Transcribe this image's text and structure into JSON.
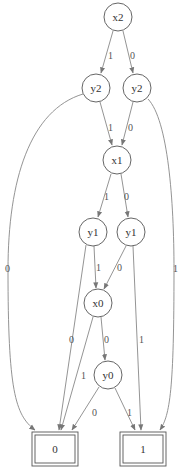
{
  "diagram": {
    "type": "binary-decision-diagram",
    "nodes": [
      {
        "id": "n_x2",
        "label": "x2",
        "cx": 118,
        "cy": 17
      },
      {
        "id": "n_y2a",
        "label": "y2",
        "cx": 96,
        "cy": 88
      },
      {
        "id": "n_y2b",
        "label": "y2",
        "cx": 137,
        "cy": 88
      },
      {
        "id": "n_x1",
        "label": "x1",
        "cx": 117,
        "cy": 160
      },
      {
        "id": "n_y1a",
        "label": "y1",
        "cx": 93,
        "cy": 232
      },
      {
        "id": "n_y1b",
        "label": "y1",
        "cx": 131,
        "cy": 232
      },
      {
        "id": "n_x0",
        "label": "x0",
        "cx": 98,
        "cy": 303
      },
      {
        "id": "n_y0",
        "label": "y0",
        "cx": 108,
        "cy": 375
      }
    ],
    "terminals": [
      {
        "id": "t0",
        "label": "0",
        "x": 32,
        "y": 432,
        "w": 46,
        "h": 34
      },
      {
        "id": "t1",
        "label": "1",
        "x": 120,
        "y": 432,
        "w": 46,
        "h": 34
      }
    ],
    "edges": [
      {
        "from": "x2",
        "to": "y2 (left)",
        "label": "1",
        "lx": 108,
        "ly": 56
      },
      {
        "from": "x2",
        "to": "y2 (right)",
        "label": "0",
        "lx": 130,
        "ly": 56
      },
      {
        "from": "y2 (left)",
        "to": "x1",
        "label": "1",
        "lx": 108,
        "ly": 129
      },
      {
        "from": "y2 (right)",
        "to": "x1",
        "label": "0",
        "lx": 129,
        "ly": 129
      },
      {
        "from": "y2 (left)",
        "to": "0",
        "label": "0",
        "lx": 8,
        "ly": 270
      },
      {
        "from": "y2 (right)",
        "to": "1",
        "label": "1",
        "lx": 174,
        "ly": 270
      },
      {
        "from": "x1",
        "to": "y1 (left)",
        "label": "1",
        "lx": 104,
        "ly": 200
      },
      {
        "from": "x1",
        "to": "y1 (right)",
        "label": "0",
        "lx": 125,
        "ly": 200
      },
      {
        "from": "y1 (left)",
        "to": "x0",
        "label": "1",
        "lx": 96,
        "ly": 271
      },
      {
        "from": "y1 (right)",
        "to": "x0",
        "label": "0",
        "lx": 117,
        "ly": 271
      },
      {
        "from": "y1 (left)",
        "to": "0",
        "label": "0",
        "lx": 72,
        "ly": 342
      },
      {
        "from": "y1 (right)",
        "to": "1",
        "label": "1",
        "lx": 139,
        "ly": 342
      },
      {
        "from": "x0",
        "to": "y0",
        "label": "0",
        "lx": 106,
        "ly": 342
      },
      {
        "from": "x0",
        "to": "0",
        "label": "1",
        "lx": 81,
        "ly": 377
      },
      {
        "from": "y0",
        "to": "0",
        "label": "0",
        "lx": 93,
        "ly": 414
      },
      {
        "from": "y0",
        "to": "1",
        "label": "1",
        "lx": 128,
        "ly": 414
      }
    ]
  },
  "labels": {
    "x2": "x2",
    "y2a": "y2",
    "y2b": "y2",
    "x1": "x1",
    "y1a": "y1",
    "y1b": "y1",
    "x0": "x0",
    "y0": "y0",
    "t0": "0",
    "t1": "1",
    "e_x2_y2a": "1",
    "e_x2_y2b": "0",
    "e_y2a_x1": "1",
    "e_y2b_x1": "0",
    "e_y2a_t0": "0",
    "e_y2b_t1": "1",
    "e_x1_y1a": "1",
    "e_x1_y1b": "0",
    "e_y1a_x0": "1",
    "e_y1b_x0": "0",
    "e_y1a_t0": "0",
    "e_y1b_t1": "1",
    "e_x0_y0": "0",
    "e_x0_t0": "1",
    "e_y0_t0": "0",
    "e_y0_t1": "1"
  },
  "colors": {
    "edge": "#888888",
    "node_stroke": "#555555",
    "background": "#ffffff"
  }
}
